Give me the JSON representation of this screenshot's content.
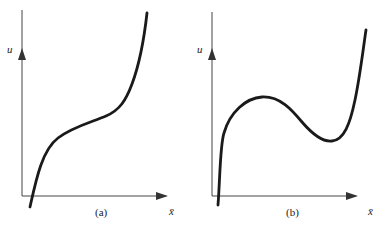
{
  "panels": [
    {
      "id": "a",
      "caption": "(a)",
      "y_label": "u",
      "x_label": "x̄",
      "description": "Monotonically increasing curve with an inflection plateau"
    },
    {
      "id": "b",
      "caption": "(b)",
      "y_label": "u",
      "x_label": "x̄",
      "description": "Non-monotonic curve with local maximum then local minimum"
    }
  ],
  "colors": {
    "curve": "#1a1a1a",
    "axis": "#333333",
    "background": "#ffffff"
  }
}
